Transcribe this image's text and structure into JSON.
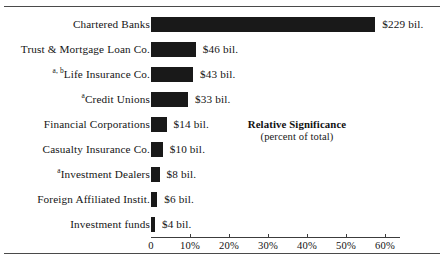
{
  "chart_data": {
    "type": "bar",
    "orientation": "horizontal",
    "title": "",
    "xlabel": "",
    "ylabel": "",
    "xlim": [
      0,
      64
    ],
    "grid": false,
    "categories": [
      "Chartered Banks",
      "Trust & Mortgage Loan Co.",
      "Life Insurance Co.",
      "Credit Unions",
      "Financial Corporations",
      "Casualty Insurance Co.",
      "Investment Dealers",
      "Foreign Affiliated Instit.",
      "Investment funds"
    ],
    "category_footnotes": [
      "",
      "",
      "a, b",
      "a",
      "",
      "",
      "a",
      "",
      ""
    ],
    "values": [
      57.5,
      11.5,
      10.8,
      9.5,
      4.0,
      3.0,
      2.2,
      1.6,
      1.0
    ],
    "value_labels": [
      "$229 bil.",
      "$46 bil.",
      "$43 bil.",
      "$33 bil.",
      "$14 bil.",
      "$10 bil.",
      "$8 bil.",
      "$6 bil.",
      "$4 bil."
    ],
    "amounts_billions": [
      229,
      46,
      43,
      33,
      14,
      10,
      8,
      6,
      4
    ],
    "xticks": [
      0,
      10,
      20,
      30,
      40,
      50,
      60
    ],
    "xtick_labels": [
      "0",
      "10%",
      "20%",
      "30%",
      "40%",
      "50%",
      "60%"
    ],
    "bar_color": "#191919",
    "legend": {
      "title": "Relative Significance",
      "subtitle": "(percent of total)",
      "position": "center-right"
    }
  }
}
